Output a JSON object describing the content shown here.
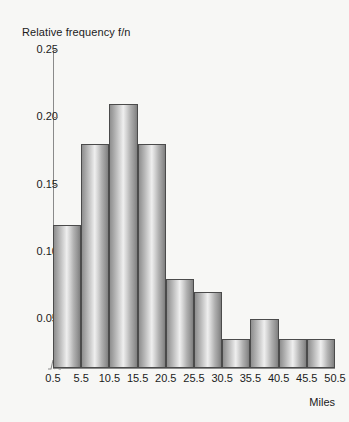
{
  "chart_data": {
    "type": "bar",
    "title": "",
    "subtitle": "",
    "xlabel": "Miles",
    "ylabel": "Relative frequency f/n",
    "categories": [
      "0.5-5.5",
      "5.5-10.5",
      "10.5-15.5",
      "15.5-20.5",
      "20.5-25.5",
      "25.5-30.5",
      "30.5-35.5",
      "35.5-40.5",
      "40.5-45.5",
      "45.5-50.5"
    ],
    "bin_edges": [
      0.5,
      5.5,
      10.5,
      15.5,
      20.5,
      25.5,
      30.5,
      35.5,
      40.5,
      45.5,
      50.5
    ],
    "values": [
      0.12,
      0.18,
      0.21,
      0.18,
      0.08,
      0.07,
      0.035,
      0.05,
      0.035,
      0.035
    ],
    "xlim": [
      0.5,
      50.5
    ],
    "ylim": [
      0,
      0.25
    ],
    "y_axis_baseline": 0,
    "y_axis_break": true,
    "grid": false,
    "legend": null,
    "y_ticks": [
      {
        "value": 0.25,
        "label": "0.25"
      },
      {
        "value": 0.2,
        "label": "0.20"
      },
      {
        "value": 0.15,
        "label": "0.15"
      },
      {
        "value": 0.1,
        "label": "0.10"
      },
      {
        "value": 0.05,
        "label": "0.05"
      }
    ],
    "x_ticks": [
      {
        "value": 0.5,
        "label": "0.5"
      },
      {
        "value": 5.5,
        "label": "5.5"
      },
      {
        "value": 10.5,
        "label": "10.5"
      },
      {
        "value": 15.5,
        "label": "15.5"
      },
      {
        "value": 20.5,
        "label": "20.5"
      },
      {
        "value": 25.5,
        "label": "25.5"
      },
      {
        "value": 30.5,
        "label": "30.5"
      },
      {
        "value": 35.5,
        "label": "35.5"
      },
      {
        "value": 40.5,
        "label": "40.5"
      },
      {
        "value": 45.5,
        "label": "45.5"
      },
      {
        "value": 50.5,
        "label": "50.5"
      }
    ],
    "colors": {
      "background": "#f7f7f5",
      "bar_outline": "#4b4b4b",
      "bar_light": "#efefef",
      "bar_dark": "#8f8f8f",
      "axis": "#8a8a8a",
      "text": "#1b1b1b"
    }
  }
}
